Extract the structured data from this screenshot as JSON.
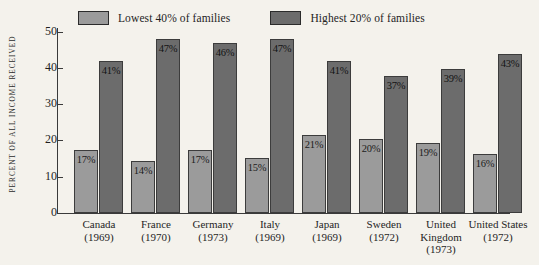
{
  "legend": {
    "items": [
      {
        "label": "Lowest 40% of families",
        "color": "#9b9b9b"
      },
      {
        "label": "Highest 20% of families",
        "color": "#6c6c6c"
      }
    ]
  },
  "axes": {
    "y_title": "PERCENT OF ALL INCOME RECEIVED",
    "y_ticks": [
      "0",
      "10",
      "20",
      "30",
      "40",
      "50"
    ]
  },
  "categories": [
    {
      "name": "Canada",
      "year": "(1969)"
    },
    {
      "name": "France",
      "year": "(1970)"
    },
    {
      "name": "Germany",
      "year": "(1973)"
    },
    {
      "name": "Italy",
      "year": "(1969)"
    },
    {
      "name": "Japan",
      "year": "(1969)"
    },
    {
      "name": "Sweden",
      "year": "(1972)"
    },
    {
      "name": "United Kingdom",
      "year": "(1973)"
    },
    {
      "name": "United States",
      "year": "(1972)"
    }
  ],
  "bar_labels": {
    "low": [
      "17%",
      "14%",
      "17%",
      "15%",
      "21%",
      "20%",
      "19%",
      "16%"
    ],
    "high": [
      "41%",
      "47%",
      "46%",
      "47%",
      "41%",
      "37%",
      "39%",
      "43%"
    ]
  },
  "chart_data": {
    "type": "bar",
    "title": "",
    "xlabel": "",
    "ylabel": "PERCENT OF ALL INCOME RECEIVED",
    "ylim": [
      0,
      50
    ],
    "yticks": [
      0,
      10,
      20,
      30,
      40,
      50
    ],
    "grid": false,
    "legend_position": "top",
    "categories": [
      "Canada (1969)",
      "France (1970)",
      "Germany (1973)",
      "Italy (1969)",
      "Japan (1969)",
      "Sweden (1972)",
      "United Kingdom (1973)",
      "United States (1972)"
    ],
    "series": [
      {
        "name": "Lowest 40% of families",
        "color": "#9b9b9b",
        "values": [
          17,
          14,
          17,
          15,
          21,
          20,
          19,
          16
        ]
      },
      {
        "name": "Highest 20% of families",
        "color": "#6c6c6c",
        "values": [
          41,
          47,
          46,
          47,
          41,
          37,
          39,
          43
        ]
      }
    ]
  }
}
